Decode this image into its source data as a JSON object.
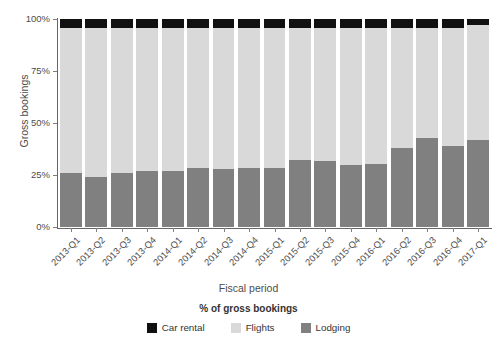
{
  "chart_data": {
    "type": "bar",
    "subtype": "stacked-100-percent",
    "title": "",
    "xlabel": "Fiscal period",
    "ylabel": "Gross bookings",
    "legend_title": "% of gross bookings",
    "legend_position": "bottom",
    "grid": false,
    "ylim": [
      0,
      100
    ],
    "y_tick_labels": [
      "0%",
      "25%",
      "50%",
      "75%",
      "100%"
    ],
    "y_tick_values": [
      0,
      25,
      50,
      75,
      100
    ],
    "categories": [
      "2013-Q1",
      "2013-Q2",
      "2013-Q3",
      "2013-Q4",
      "2014-Q1",
      "2014-Q2",
      "2014-Q3",
      "2014-Q4",
      "2015-Q1",
      "2015-Q2",
      "2015-Q3",
      "2015-Q4",
      "2016-Q1",
      "2016-Q2",
      "2016-Q3",
      "2016-Q4",
      "2017-Q1"
    ],
    "series": [
      {
        "name": "Lodging",
        "color": "#808080",
        "values": [
          26,
          24,
          26,
          27,
          27,
          28.5,
          28,
          28.5,
          28.5,
          32,
          31.5,
          30,
          30.5,
          38,
          43,
          39,
          42
        ]
      },
      {
        "name": "Flights",
        "color": "#d9d9d9",
        "values": [
          69.5,
          71.5,
          69.5,
          68.5,
          68.5,
          67,
          67.5,
          67,
          67,
          63.5,
          64,
          65.5,
          65,
          57.5,
          52.5,
          56.5,
          55
        ]
      },
      {
        "name": "Car rental",
        "color": "#111111",
        "values": [
          4.5,
          4.5,
          4.5,
          4.5,
          4.5,
          4.5,
          4.5,
          4.5,
          4.5,
          4.5,
          4.5,
          4.5,
          4.5,
          4.5,
          4.5,
          4.5,
          3
        ]
      }
    ],
    "legend_entries": [
      {
        "label": "Car rental",
        "color": "#111111"
      },
      {
        "label": "Flights",
        "color": "#d9d9d9"
      },
      {
        "label": "Lodging",
        "color": "#808080"
      }
    ]
  }
}
